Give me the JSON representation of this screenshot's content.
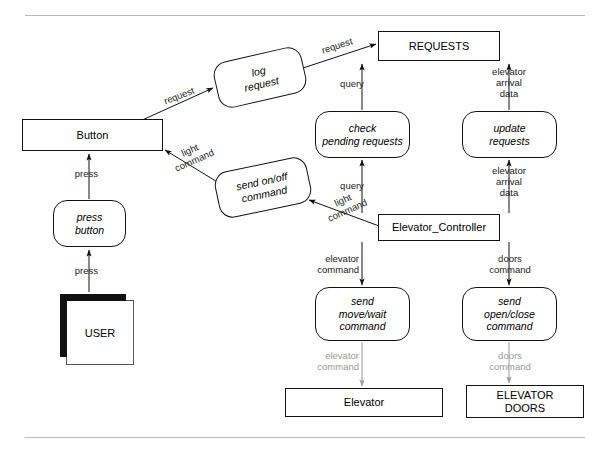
{
  "diagram": {
    "type": "data-flow-diagram",
    "rules": [
      {
        "name": "top-rule",
        "x": 25,
        "y": 15,
        "width": 560
      },
      {
        "name": "bottom-rule",
        "x": 25,
        "y": 437,
        "width": 560
      }
    ],
    "nodes": [
      {
        "id": "requests_store",
        "label": "REQUESTS",
        "shape": "rectangle-store",
        "x": 378,
        "y": 31,
        "w": 122,
        "h": 30
      },
      {
        "id": "button",
        "label": "Button",
        "shape": "rectangle-store",
        "x": 22,
        "y": 119,
        "w": 141,
        "h": 32
      },
      {
        "id": "log_request",
        "label": "log\nrequest",
        "shape": "rounded-process",
        "x": 215,
        "y": 54,
        "w": 90,
        "h": 47,
        "rotation": -13
      },
      {
        "id": "send_on_off",
        "label": "send on/off\ncommand",
        "shape": "rounded-process",
        "x": 216,
        "y": 164,
        "w": 94,
        "h": 47,
        "rotation": -12
      },
      {
        "id": "check_pending",
        "label": "check\npending requests",
        "shape": "rounded-process",
        "x": 315,
        "y": 111,
        "w": 95,
        "h": 47,
        "rotation": 0
      },
      {
        "id": "update_requests",
        "label": "update\nrequests",
        "shape": "rounded-process",
        "x": 462,
        "y": 111,
        "w": 95,
        "h": 47,
        "rotation": 0
      },
      {
        "id": "elevator_controller",
        "label": "Elevator_Controller",
        "shape": "rectangle-store",
        "x": 378,
        "y": 214,
        "w": 122,
        "h": 27
      },
      {
        "id": "press_button",
        "label": "press\nbutton",
        "shape": "rounded-process",
        "x": 53,
        "y": 200,
        "w": 73,
        "h": 47,
        "rotation": 0
      },
      {
        "id": "user",
        "label": "USER",
        "shape": "actor",
        "x": 59,
        "y": 293,
        "w": 68,
        "h": 65
      },
      {
        "id": "send_move_wait",
        "label": "send\nmove/wait\ncommand",
        "shape": "rounded-process",
        "x": 315,
        "y": 287,
        "w": 95,
        "h": 54,
        "rotation": 0
      },
      {
        "id": "send_open_close",
        "label": "send\nopen/close\ncommand",
        "shape": "rounded-process",
        "x": 462,
        "y": 287,
        "w": 95,
        "h": 54,
        "rotation": 0
      },
      {
        "id": "elevator_store",
        "label": "Elevator",
        "shape": "rectangle-store",
        "x": 285,
        "y": 388,
        "w": 158,
        "h": 29
      },
      {
        "id": "elevator_doors_store",
        "label": "ELEVATOR\nDOORS",
        "shape": "rectangle-store",
        "x": 466,
        "y": 385,
        "w": 118,
        "h": 33
      }
    ],
    "edges": [
      {
        "id": "e_button_log",
        "from": "button",
        "to": "log_request",
        "label": "request",
        "label_rotation": -21
      },
      {
        "id": "e_log_requests",
        "from": "log_request",
        "to": "requests_store",
        "label": "request",
        "label_rotation": -18
      },
      {
        "id": "e_check_requests",
        "from": "check_pending",
        "to": "requests_store",
        "label": "query"
      },
      {
        "id": "e_update_requests",
        "from": "update_requests",
        "to": "requests_store",
        "label": "elevator\narrival\ndata"
      },
      {
        "id": "e_ctrl_check",
        "from": "elevator_controller",
        "to": "check_pending",
        "label": "query"
      },
      {
        "id": "e_ctrl_update",
        "from": "elevator_controller",
        "to": "update_requests",
        "label": "elevator\narrival\ndata"
      },
      {
        "id": "e_ctrl_sendonoff",
        "from": "elevator_controller",
        "to": "send_on_off",
        "label": "light\ncommand",
        "label_rotation": -24
      },
      {
        "id": "e_sendonoff_button",
        "from": "send_on_off",
        "to": "button",
        "label": "light\ncommand",
        "label_rotation": -24
      },
      {
        "id": "e_pressbutton_button",
        "from": "press_button",
        "to": "button",
        "label": "press"
      },
      {
        "id": "e_user_pressbutton",
        "from": "user",
        "to": "press_button",
        "label": "press"
      },
      {
        "id": "e_ctrl_move",
        "from": "elevator_controller",
        "to": "send_move_wait",
        "label": "elevator\ncommand"
      },
      {
        "id": "e_ctrl_doors",
        "from": "elevator_controller",
        "to": "send_open_close",
        "label": "doors\ncommand"
      },
      {
        "id": "e_move_elevator",
        "from": "send_move_wait",
        "to": "elevator_store",
        "label": "elevator\ncommand",
        "muted": true
      },
      {
        "id": "e_doors_elevatordoors",
        "from": "send_open_close",
        "to": "elevator_doors_store",
        "label": "doors\ncommand",
        "muted": true
      }
    ],
    "labels": {
      "request_button_to_log": "request",
      "request_log_to_store": "request",
      "query_check_to_store": "query",
      "query_ctrl_to_check": "query",
      "elevator_arrival_data_update_to_store": "elevator\narrival\ndata",
      "elevator_arrival_data_ctrl_to_update": "elevator\narrival\ndata",
      "light_command_to_button": "light\ncommand",
      "light_command_from_ctrl": "light\ncommand",
      "press_to_button": "press",
      "press_from_user": "press",
      "elevator_command_ctrl": "elevator\ncommand",
      "doors_command_ctrl": "doors\ncommand",
      "elevator_command_muted": "elevator\ncommand",
      "doors_command_muted": "doors\ncommand"
    },
    "colors": {
      "stroke": "#111111",
      "muted_text": "#9a9a9a",
      "rule": "#b9b9b9",
      "background": "#ffffff"
    }
  }
}
